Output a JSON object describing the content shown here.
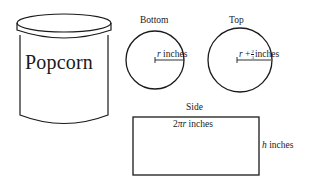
{
  "can": {
    "label": "Popcorn"
  },
  "bottom": {
    "title": "Bottom",
    "radius_var": "r",
    "radius_unit": "inches"
  },
  "top": {
    "title": "Top",
    "radius_var": "r",
    "plus": "+",
    "frac_num": "2",
    "frac_den": "3",
    "radius_unit": "inches"
  },
  "side": {
    "title": "Side",
    "width_coef": "2",
    "width_pi": "π",
    "width_var": "r",
    "width_unit": "inches",
    "height_var": "h",
    "height_unit": "inches"
  },
  "colors": {
    "stroke": "#1a1a1a",
    "background": "#ffffff"
  }
}
